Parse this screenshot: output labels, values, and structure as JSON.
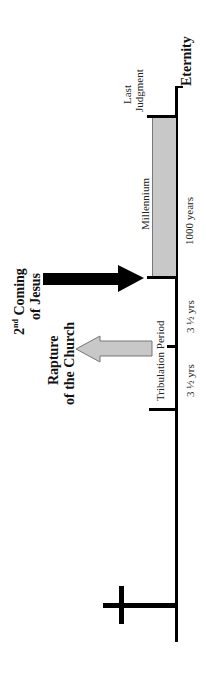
{
  "labels": {
    "eternity": "Eternity",
    "last_judgment_line1": "Last",
    "last_judgment_line2": "Judgment",
    "millennium": "Millennium",
    "millennium_duration": "1000 years",
    "second_coming_prefix": "2",
    "second_coming_sup": "nd",
    "second_coming_line1_rest": " Coming",
    "second_coming_line2": "of Jesus",
    "rapture_line1": "Rapture",
    "rapture_line2": "of the Church",
    "tribulation": "Tribulation Period",
    "tribulation_half_1": "3 ½ yrs",
    "tribulation_half_2": "3 ½ yrs"
  },
  "icons": {
    "cross": "cross-icon",
    "second_coming_arrow": "black-arrow",
    "rapture_arrow": "gray-arrow"
  },
  "colors": {
    "axis": "#000000",
    "millennium_fill": "#c8c8c8",
    "rapture_arrow_fill": "#c8c8c8",
    "second_coming_arrow_fill": "#000000"
  }
}
